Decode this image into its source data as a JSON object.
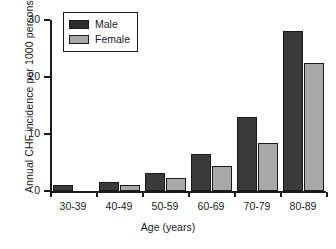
{
  "chart_data": {
    "type": "bar",
    "title": "",
    "xlabel": "Age (years)",
    "ylabel": "Annual CHF incidence per 1000 persons",
    "categories": [
      "30-39",
      "40-49",
      "50-59",
      "60-69",
      "70-79",
      "80-89"
    ],
    "series": [
      {
        "name": "Male",
        "color": "#3a3a3a",
        "values": [
          1.0,
          1.6,
          3.2,
          6.5,
          12.9,
          28.0
        ]
      },
      {
        "name": "Female",
        "color": "#a8a8a8",
        "values": [
          0.0,
          1.1,
          2.2,
          4.4,
          8.5,
          22.4
        ]
      }
    ],
    "ylim": [
      0,
      30
    ],
    "yticks": [
      0,
      10,
      20,
      30
    ],
    "ytick_labels": [
      "0",
      "10",
      "20",
      "30"
    ],
    "grid": false,
    "legend_position": "top-left"
  },
  "axes": {
    "y_title": "Annual CHF incidence per 1000 persons",
    "x_title": "Age (years)"
  },
  "legend": {
    "items": [
      {
        "label": "Male"
      },
      {
        "label": "Female"
      }
    ]
  }
}
